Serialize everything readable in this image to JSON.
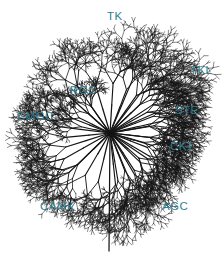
{
  "figure": {
    "name": "human-kinome-tree",
    "type": "radial-dendrogram",
    "width": 222,
    "height": 254,
    "background_color": "#ffffff",
    "branch_color": "#151515",
    "label_color": "#2d7f92",
    "center": {
      "x": 110,
      "y": 133
    }
  },
  "groups": [
    {
      "id": "tk",
      "label": "TK",
      "x": 107,
      "y": 10,
      "angle": -95,
      "reach": 122,
      "spread": 46,
      "density": 1.05
    },
    {
      "id": "tkl",
      "label": "TKL",
      "x": 190,
      "y": 64,
      "angle": -40,
      "reach": 108,
      "spread": 30,
      "density": 0.95
    },
    {
      "id": "ste",
      "label": "STE",
      "x": 175,
      "y": 104,
      "angle": -12,
      "reach": 100,
      "spread": 30,
      "density": 1.0
    },
    {
      "id": "ck1",
      "label": "CK1",
      "x": 170,
      "y": 140,
      "angle": 18,
      "reach": 86,
      "spread": 26,
      "density": 0.9
    },
    {
      "id": "agc",
      "label": "AGC",
      "x": 162,
      "y": 200,
      "angle": 52,
      "reach": 100,
      "spread": 32,
      "density": 1.0
    },
    {
      "id": "camk",
      "label": "CAMK",
      "x": 40,
      "y": 200,
      "angle": 96,
      "reach": 118,
      "spread": 42,
      "density": 1.05
    },
    {
      "id": "cmgc",
      "label": "CMGC",
      "x": 17,
      "y": 110,
      "angle": 170,
      "reach": 104,
      "spread": 34,
      "density": 1.0
    },
    {
      "id": "rgc",
      "label": "RGC",
      "x": 70,
      "y": 84,
      "angle": -145,
      "reach": 72,
      "spread": 20,
      "density": 0.7
    }
  ],
  "render": {
    "seed": 20240517,
    "depth": 7,
    "base_stroke": 1.25,
    "tip_stroke": 0.5,
    "branch_decay": 0.71,
    "angle_jitter": 0.38
  }
}
